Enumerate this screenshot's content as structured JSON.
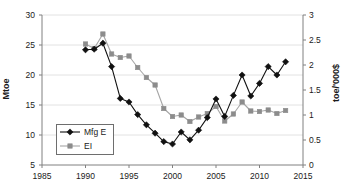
{
  "chart_data": {
    "type": "line",
    "title": "",
    "xlabel": "",
    "ylabel": "Mtoe",
    "ylabel_secondary": "toe/'000$",
    "grid": true,
    "legend_position": "inside-bottom-left",
    "xlim": [
      1985,
      2015
    ],
    "ylim": [
      5,
      30
    ],
    "ylim_secondary": [
      0,
      3
    ],
    "xticks": [
      1985,
      1990,
      1995,
      2000,
      2005,
      2010,
      2015
    ],
    "xtick_labels": [
      "1985",
      "1990",
      "1995",
      "2000",
      "2005",
      "2010",
      "2015"
    ],
    "yticks": [
      5,
      10,
      15,
      20,
      25,
      30
    ],
    "ytick_labels": [
      "5",
      "10",
      "15",
      "20",
      "25",
      "30"
    ],
    "yticks_secondary": [
      0,
      0.5,
      1,
      1.5,
      2,
      2.5,
      3
    ],
    "ytick_labels_secondary": [
      "0",
      "0.5",
      "1",
      "1.5",
      "2",
      "2.5",
      "3"
    ],
    "x": [
      1990,
      1991,
      1992,
      1993,
      1994,
      1995,
      1996,
      1997,
      1998,
      1999,
      2000,
      2001,
      2002,
      2003,
      2004,
      2005,
      2006,
      2007,
      2008,
      2009,
      2010,
      2011,
      2012,
      2013
    ],
    "series": [
      {
        "name": "Mfg E",
        "axis": "left",
        "marker": "diamond",
        "color": "#111111",
        "line_color": "#111111",
        "values": [
          24.2,
          24.3,
          25.3,
          21.4,
          16.1,
          15.5,
          13.4,
          11.7,
          10.3,
          8.9,
          8.5,
          10.5,
          9.2,
          10.8,
          12.9,
          16.0,
          13.1,
          16.6,
          20.0,
          16.5,
          18.6,
          21.4,
          20.0,
          22.2
        ]
      },
      {
        "name": "EI",
        "axis": "right",
        "marker": "square",
        "color": "#8c8c8c",
        "line_color": "#a6a6a6",
        "values": [
          2.42,
          2.33,
          2.62,
          2.22,
          2.15,
          2.18,
          1.95,
          1.75,
          1.6,
          1.13,
          0.97,
          1.0,
          0.87,
          0.96,
          1.03,
          1.17,
          0.88,
          1.02,
          1.26,
          1.08,
          1.07,
          1.1,
          1.03,
          1.09
        ]
      }
    ]
  },
  "legend": {
    "entries": [
      {
        "label": "Mfg E"
      },
      {
        "label": "EI"
      }
    ]
  },
  "axes": {
    "left_title": "Mtoe",
    "right_title": "toe/'000$"
  }
}
